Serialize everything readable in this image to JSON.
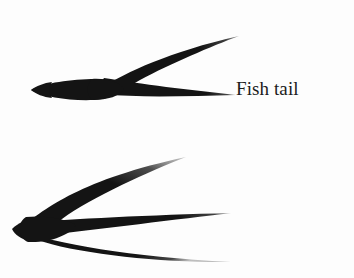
{
  "figure": {
    "background_color": "#fdfdfd",
    "ink_color": "#141414",
    "width": 354,
    "height": 278
  },
  "items": [
    {
      "id": "fish-tail",
      "label": "Fish tail",
      "icon_name": "fish-tail-stroke-icon",
      "prongs": 2,
      "description": "Two-pronged forked brush stroke with a thick blunt body tapering left and two tapering prongs opening to the right"
    },
    {
      "id": "bird-claw",
      "label": "Bird claw",
      "icon_name": "bird-claw-stroke-icon",
      "prongs": 3,
      "description": "Three-pronged brush stroke converging to a sharp point at the left with three tapering prongs fanning to the right"
    }
  ]
}
